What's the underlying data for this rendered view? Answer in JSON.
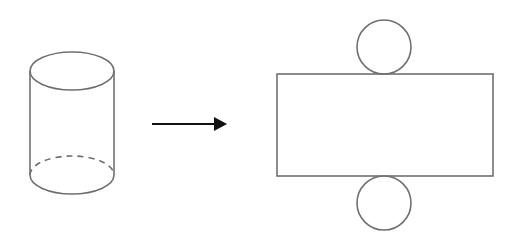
{
  "diagram": {
    "colors": {
      "stroke": "#707070",
      "arrow": "#111111",
      "background": "#ffffff"
    },
    "shapes": {
      "cylinder": {
        "cx": 72,
        "top_cy": 71,
        "bottom_cy": 175,
        "rx": 42,
        "ry": 19,
        "hidden_edge": "dashed"
      },
      "arrow": {
        "x1": 152,
        "x2": 226,
        "y": 124
      },
      "net_rectangle": {
        "x": 277,
        "y": 73,
        "width": 216,
        "height": 103
      },
      "net_top_circle": {
        "cx": 384,
        "cy": 47,
        "r": 27
      },
      "net_bottom_circle": {
        "cx": 384,
        "cy": 202,
        "r": 27
      }
    }
  }
}
